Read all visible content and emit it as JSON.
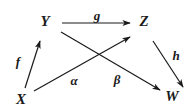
{
  "diagram": {
    "type": "commutative-diagram",
    "nodes": [
      {
        "id": "Y",
        "label": "Y",
        "x": 45,
        "y": 21
      },
      {
        "id": "Z",
        "label": "Z",
        "x": 144,
        "y": 21
      },
      {
        "id": "X",
        "label": "X",
        "x": 21,
        "y": 99
      },
      {
        "id": "W",
        "label": "W",
        "x": 172,
        "y": 96
      }
    ],
    "edges": [
      {
        "id": "g",
        "from": "Y",
        "to": "Z",
        "label": "g",
        "label_x": 97,
        "label_y": 15
      },
      {
        "id": "f",
        "from": "X",
        "to": "Y",
        "label": "f",
        "label_x": 18,
        "label_y": 61
      },
      {
        "id": "alpha",
        "from": "X",
        "to": "Z",
        "label": "α",
        "label_x": 74,
        "label_y": 80
      },
      {
        "id": "beta",
        "from": "Y",
        "to": "W",
        "label": "β",
        "label_x": 117,
        "label_y": 79
      },
      {
        "id": "h",
        "from": "Z",
        "to": "W",
        "label": "h",
        "label_x": 176,
        "label_y": 55
      }
    ],
    "line_color": "#1a1a1a",
    "background": "#ffffff"
  }
}
